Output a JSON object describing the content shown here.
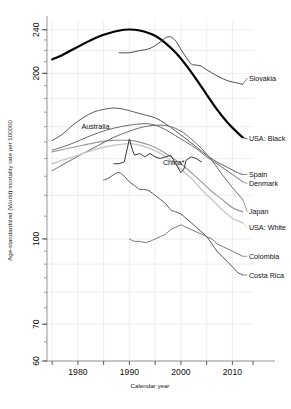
{
  "chart_data": {
    "type": "line",
    "title": "",
    "xlabel": "Calendar year",
    "ylabel": "Age-standardized (World) mortality rate per 100000",
    "yscale": "log",
    "ylim": [
      60,
      250
    ],
    "xlim": [
      1974,
      2014
    ],
    "ytick_labels": [
      "240",
      "200",
      "100",
      "70",
      "60"
    ],
    "ytick_values": [
      240,
      200,
      100,
      70,
      60
    ],
    "xtick_labels": [
      "1980",
      "1990",
      "2000",
      "2010"
    ],
    "xtick_values": [
      1980,
      1990,
      2000,
      2010
    ],
    "grid": true,
    "legend_position": "right-inline",
    "footnote": "* China label marked with asterisk",
    "series": [
      {
        "name": "USA: Black",
        "label": "USA: Black",
        "color": "#000000",
        "width": 2.2,
        "label_x": 2013.2,
        "label_y": 152,
        "points": [
          [
            1975,
            212
          ],
          [
            1977,
            216
          ],
          [
            1979,
            221
          ],
          [
            1981,
            226
          ],
          [
            1983,
            231
          ],
          [
            1985,
            235
          ],
          [
            1987,
            238
          ],
          [
            1989,
            240
          ],
          [
            1991,
            240
          ],
          [
            1993,
            238
          ],
          [
            1995,
            234
          ],
          [
            1997,
            227
          ],
          [
            1999,
            218
          ],
          [
            2001,
            207
          ],
          [
            2003,
            195
          ],
          [
            2005,
            183
          ],
          [
            2007,
            172
          ],
          [
            2009,
            163
          ],
          [
            2011,
            156
          ],
          [
            2012,
            153
          ]
        ]
      },
      {
        "name": "Slovakia",
        "label": "Slovakia",
        "color": "#4a4a4a",
        "width": 1.0,
        "label_x": 2013.2,
        "label_y": 196,
        "points": [
          [
            1988,
            218
          ],
          [
            1990,
            218
          ],
          [
            1992,
            220
          ],
          [
            1994,
            222
          ],
          [
            1996,
            228
          ],
          [
            1997,
            232
          ],
          [
            1998,
            233
          ],
          [
            1999,
            229
          ],
          [
            2000,
            221
          ],
          [
            2001,
            214
          ],
          [
            2002,
            208
          ],
          [
            2003,
            207
          ],
          [
            2004,
            206
          ],
          [
            2005,
            203
          ],
          [
            2007,
            198
          ],
          [
            2009,
            194
          ],
          [
            2011,
            192
          ],
          [
            2012,
            191
          ]
        ]
      },
      {
        "name": "Spain",
        "label": "Spain",
        "color": "#5a5a5a",
        "width": 1.0,
        "label_x": 2013.2,
        "label_y": 131,
        "points": [
          [
            1975,
            151
          ],
          [
            1977,
            155
          ],
          [
            1979,
            161
          ],
          [
            1981,
            166
          ],
          [
            1983,
            170
          ],
          [
            1985,
            172
          ],
          [
            1987,
            173
          ],
          [
            1989,
            172
          ],
          [
            1991,
            170
          ],
          [
            1993,
            168
          ],
          [
            1995,
            166
          ],
          [
            1997,
            162
          ],
          [
            1999,
            157
          ],
          [
            2001,
            152
          ],
          [
            2003,
            147
          ],
          [
            2005,
            142
          ],
          [
            2007,
            138
          ],
          [
            2009,
            135
          ],
          [
            2011,
            132
          ],
          [
            2012,
            131
          ]
        ]
      },
      {
        "name": "Denmark",
        "label": "Denmark",
        "color": "#6b6b6b",
        "width": 1.0,
        "label_x": 2013.2,
        "label_y": 126,
        "points": [
          [
            1975,
            145
          ],
          [
            1978,
            148
          ],
          [
            1981,
            152
          ],
          [
            1984,
            156
          ],
          [
            1987,
            159
          ],
          [
            1990,
            161
          ],
          [
            1993,
            162
          ],
          [
            1995,
            161
          ],
          [
            1997,
            158
          ],
          [
            1999,
            154
          ],
          [
            2001,
            150
          ],
          [
            2003,
            146
          ],
          [
            2005,
            141
          ],
          [
            2007,
            137
          ],
          [
            2009,
            133
          ],
          [
            2011,
            129
          ],
          [
            2012,
            127
          ]
        ]
      },
      {
        "name": "Australia",
        "label": "Australia",
        "color": "#9a9a9a",
        "width": 1.2,
        "label_x": 1983.4,
        "label_y": 160,
        "inline": true,
        "points": [
          [
            1975,
            144
          ],
          [
            1978,
            146
          ],
          [
            1981,
            148
          ],
          [
            1984,
            150
          ],
          [
            1987,
            151
          ],
          [
            1990,
            151
          ],
          [
            1992,
            150
          ],
          [
            1994,
            148
          ],
          [
            1996,
            145
          ],
          [
            1998,
            141
          ],
          [
            2000,
            137
          ],
          [
            2002,
            132
          ],
          [
            2004,
            127
          ],
          [
            2006,
            122
          ],
          [
            2008,
            118
          ],
          [
            2010,
            114
          ],
          [
            2012,
            112
          ]
        ]
      },
      {
        "name": "Japan",
        "label": "Japan",
        "color": "#6b6b6b",
        "width": 1.0,
        "label_x": 2013.2,
        "label_y": 112,
        "points": [
          [
            1975,
            133
          ],
          [
            1978,
            138
          ],
          [
            1981,
            143
          ],
          [
            1984,
            148
          ],
          [
            1987,
            153
          ],
          [
            1990,
            157
          ],
          [
            1993,
            160
          ],
          [
            1996,
            161
          ],
          [
            1998,
            160
          ],
          [
            2000,
            157
          ],
          [
            2002,
            152
          ],
          [
            2004,
            146
          ],
          [
            2006,
            139
          ],
          [
            2008,
            131
          ],
          [
            2010,
            124
          ],
          [
            2012,
            118
          ]
        ]
      },
      {
        "name": "USA: White",
        "label": "USA: White",
        "color": "#c9c9c9",
        "width": 1.4,
        "label_x": 2013.2,
        "label_y": 105,
        "points": [
          [
            1975,
            137
          ],
          [
            1978,
            140
          ],
          [
            1981,
            143
          ],
          [
            1984,
            146
          ],
          [
            1987,
            148
          ],
          [
            1990,
            149
          ],
          [
            1992,
            148
          ],
          [
            1994,
            146
          ],
          [
            1996,
            143
          ],
          [
            1998,
            139
          ],
          [
            2000,
            134
          ],
          [
            2002,
            129
          ],
          [
            2004,
            123
          ],
          [
            2006,
            118
          ],
          [
            2008,
            113
          ],
          [
            2010,
            109
          ],
          [
            2012,
            107
          ]
        ]
      },
      {
        "name": "China*",
        "label": "China*",
        "color": "#3a3a3a",
        "width": 1.0,
        "label_x": 1998.6,
        "label_y": 138,
        "inline": true,
        "points": [
          [
            1987,
            137
          ],
          [
            1988,
            137
          ],
          [
            1989,
            138
          ],
          [
            1990,
            152
          ],
          [
            1990.6,
            145
          ],
          [
            1991,
            142
          ],
          [
            1992,
            143
          ],
          [
            1993,
            141
          ],
          [
            1994,
            143
          ],
          [
            1995,
            141
          ],
          [
            1996,
            140
          ],
          [
            1997,
            141
          ],
          [
            1998,
            142
          ],
          [
            1999,
            137
          ],
          [
            2000,
            132
          ],
          [
            2000.6,
            134
          ],
          [
            2001,
            139
          ],
          [
            2002,
            141
          ],
          [
            2003,
            140
          ],
          [
            2004,
            138
          ]
        ]
      },
      {
        "name": "Costa Rica",
        "label": "Costa Rica",
        "color": "#555555",
        "width": 1.0,
        "label_x": 2013.2,
        "label_y": 86,
        "points": [
          [
            1985,
            128
          ],
          [
            1986,
            129
          ],
          [
            1987,
            131
          ],
          [
            1988,
            132
          ],
          [
            1989,
            130
          ],
          [
            1990,
            127
          ],
          [
            1991,
            125
          ],
          [
            1992,
            123
          ],
          [
            1993,
            123
          ],
          [
            1994,
            122
          ],
          [
            1995,
            120
          ],
          [
            1996,
            118
          ],
          [
            1997,
            116
          ],
          [
            1998,
            113
          ],
          [
            1999,
            112
          ],
          [
            2000,
            111
          ],
          [
            2001,
            109
          ],
          [
            2002,
            107
          ],
          [
            2003,
            105
          ],
          [
            2004,
            103
          ],
          [
            2005,
            101
          ],
          [
            2006,
            98
          ],
          [
            2007,
            95
          ],
          [
            2008,
            93
          ],
          [
            2009,
            91
          ],
          [
            2010,
            89
          ],
          [
            2011,
            87
          ],
          [
            2012,
            86
          ]
        ]
      },
      {
        "name": "Colombia",
        "label": "Colombia",
        "color": "#777777",
        "width": 1.0,
        "label_x": 2013.2,
        "label_y": 93,
        "points": [
          [
            1990,
            100
          ],
          [
            1991,
            99
          ],
          [
            1992,
            99
          ],
          [
            1993,
            98.5
          ],
          [
            1994,
            99
          ],
          [
            1995,
            100
          ],
          [
            1996,
            101
          ],
          [
            1997,
            102
          ],
          [
            1998,
            104
          ],
          [
            1999,
            105
          ],
          [
            2000,
            106
          ],
          [
            2001,
            105
          ],
          [
            2002,
            104
          ],
          [
            2003,
            103
          ],
          [
            2004,
            102
          ],
          [
            2005,
            101
          ],
          [
            2006,
            100
          ],
          [
            2007,
            98
          ],
          [
            2008,
            97
          ],
          [
            2009,
            96
          ],
          [
            2010,
            95
          ],
          [
            2011,
            94
          ],
          [
            2012,
            93
          ]
        ]
      }
    ]
  },
  "layout": {
    "plot_left": 47,
    "plot_right": 253,
    "plot_top": 20,
    "plot_bottom": 361,
    "grid_color": "#e3e3ea",
    "axis_color": "#8a8a8a"
  }
}
